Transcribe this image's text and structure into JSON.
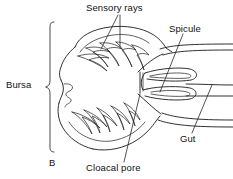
{
  "figure": {
    "panel_label": "B",
    "background_color": "#ffffff",
    "line_color": "#1a1a1a",
    "text_color": "#111111"
  },
  "labels": {
    "sensory_rays": "Sensory rays",
    "spicule": "Spicule",
    "bursa": "Bursa",
    "gut": "Gut",
    "cloacal_pore": "Cloacal pore"
  }
}
